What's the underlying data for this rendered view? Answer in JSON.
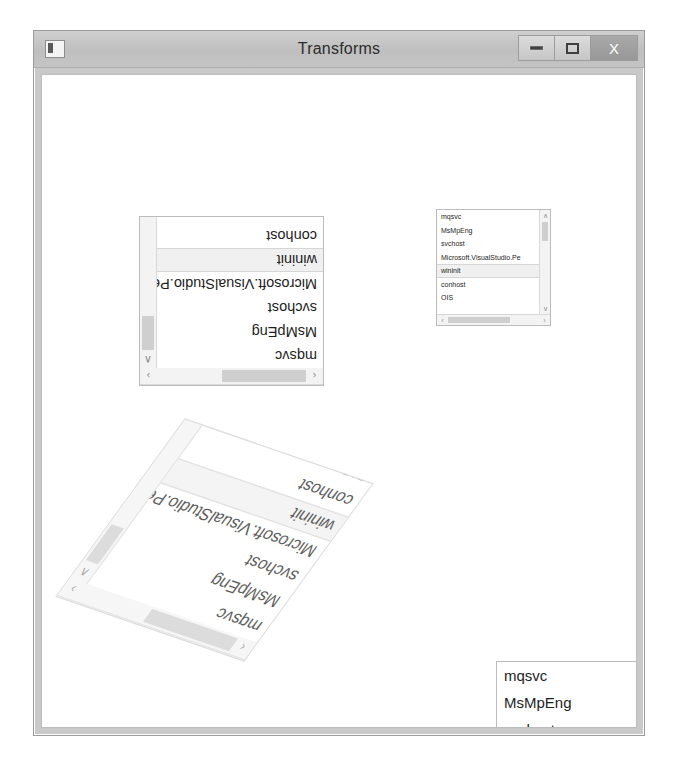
{
  "window": {
    "title": "Transforms",
    "icon": "app-icon",
    "buttons": {
      "minimize": "minimize",
      "maximize": "maximize",
      "close": "×"
    },
    "close_label": "X"
  },
  "colors": {
    "window_frame": "#c9c9c9",
    "titlebar": "#c4c4c4",
    "client_background": "#ffffff",
    "listbox_border": "#bcbcbc",
    "selection": "#f0f0f0",
    "scrollbar_track": "#f3f3f3",
    "scrollbar_thumb": "#cfcfcf",
    "text": "#1e1e1e",
    "close_button": "#9e9e9e"
  },
  "process_items": [
    "mqsvc",
    "MsMpEng",
    "svchost",
    "Microsoft.VisualStudio.Pe",
    "wininit",
    "conhost",
    "OIS"
  ],
  "listboxes": [
    {
      "id": "rotated-180-listbox",
      "name": "listbox-rotated-180",
      "transform": "rotate(180deg)",
      "selected_index": 4,
      "scrollbars": {
        "vertical": true,
        "horizontal": true
      },
      "items": [
        "mqsvc",
        "MsMpEng",
        "svchost",
        "Microsoft.VisualStudio.Pe",
        "wininit",
        "conhost",
        "OIS"
      ]
    },
    {
      "id": "small-scaled-listbox",
      "name": "listbox-scaled-small",
      "transform": "scale(0.62)",
      "selected_index": 4,
      "scrollbars": {
        "vertical": true,
        "horizontal": true
      },
      "items": [
        "mqsvc",
        "MsMpEng",
        "svchost",
        "Microsoft.VisualStudio.Pe",
        "wininit",
        "conhost",
        "OIS"
      ]
    },
    {
      "id": "skewed-rotated-listbox",
      "name": "listbox-skewed-rotated",
      "transform": "rotate(199deg) skewX(-17deg)",
      "selected_index": 4,
      "scrollbars": {
        "vertical": true,
        "horizontal": true
      },
      "items": [
        "mqsvc",
        "MsMpEng",
        "svchost",
        "Microsoft.VisualStudio.Pe",
        "wininit",
        "conhost",
        "OIS"
      ]
    },
    {
      "id": "large-listbox",
      "name": "listbox-large-normal",
      "transform": "none",
      "selected_index": 3,
      "scrollbars": {
        "vertical": true,
        "horizontal": false
      },
      "items": [
        "mqsvc",
        "MsMpEng",
        "svchost",
        "Microsoft.VisualStudio.Pe",
        "wininit",
        "conhost"
      ]
    }
  ],
  "scroll_glyphs": {
    "up": "∧",
    "down": "∨",
    "left": "‹",
    "right": "›"
  }
}
